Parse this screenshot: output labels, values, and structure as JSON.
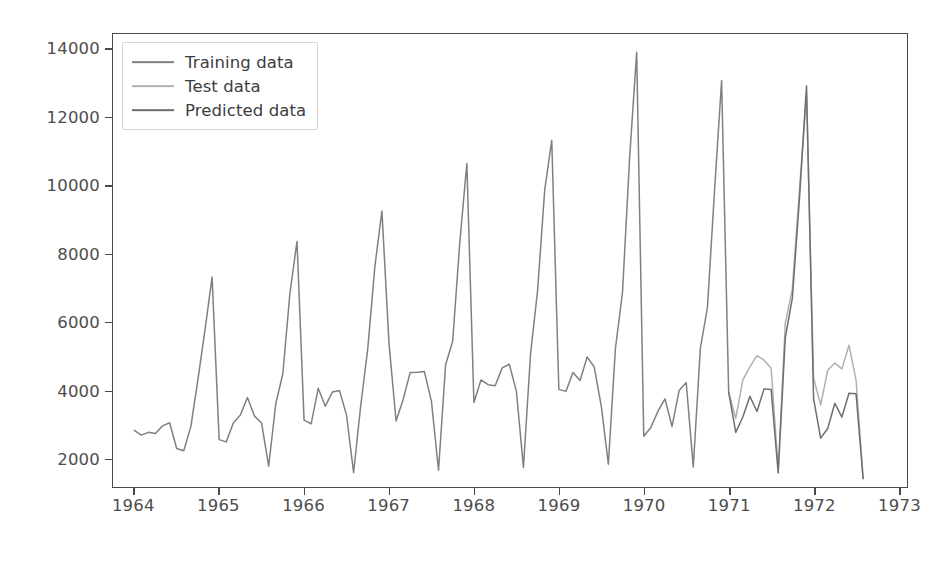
{
  "figure": {
    "background_color": "#ffffff",
    "axes_color": "#4a4a4a",
    "tick_label_color": "#4d4d4d"
  },
  "legend": {
    "position": "upper left",
    "entries": [
      {
        "label": "Training data",
        "color": "#808080",
        "icon": "line-swatch-icon"
      },
      {
        "label": "Test data",
        "color": "#b0b0b0",
        "icon": "line-swatch-icon"
      },
      {
        "label": "Predicted data",
        "color": "#6e6e6e",
        "icon": "line-swatch-icon"
      }
    ]
  },
  "chart_data": {
    "type": "line",
    "title": "",
    "xlabel": "",
    "ylabel": "",
    "xlim": [
      1963.75,
      1973.1
    ],
    "ylim": [
      1150,
      14450
    ],
    "grid": false,
    "legend_position": "upper left",
    "xticks": [
      1964,
      1965,
      1966,
      1967,
      1968,
      1969,
      1970,
      1971,
      1972,
      1973
    ],
    "xtick_labels": [
      "1964",
      "1965",
      "1966",
      "1967",
      "1968",
      "1969",
      "1970",
      "1971",
      "1972",
      "1973"
    ],
    "yticks": [
      2000,
      4000,
      6000,
      8000,
      10000,
      12000,
      14000
    ],
    "ytick_labels": [
      "2000",
      "4000",
      "6000",
      "8000",
      "10000",
      "12000",
      "14000"
    ],
    "series": [
      {
        "name": "Training data",
        "color": "#808080",
        "x": [
          1964.0,
          1964.0833,
          1964.1667,
          1964.25,
          1964.3333,
          1964.4167,
          1964.5,
          1964.5833,
          1964.6667,
          1964.75,
          1964.8333,
          1964.9167,
          1965.0,
          1965.0833,
          1965.1667,
          1965.25,
          1965.3333,
          1965.4167,
          1965.5,
          1965.5833,
          1965.6667,
          1965.75,
          1965.8333,
          1965.9167,
          1966.0,
          1966.0833,
          1966.1667,
          1966.25,
          1966.3333,
          1966.4167,
          1966.5,
          1966.5833,
          1966.6667,
          1966.75,
          1966.8333,
          1966.9167,
          1967.0,
          1967.0833,
          1967.1667,
          1967.25,
          1967.3333,
          1967.4167,
          1967.5,
          1967.5833,
          1967.6667,
          1967.75,
          1967.8333,
          1967.9167,
          1968.0,
          1968.0833,
          1968.1667,
          1968.25,
          1968.3333,
          1968.4167,
          1968.5,
          1968.5833,
          1968.6667,
          1968.75,
          1968.8333,
          1968.9167,
          1969.0,
          1969.0833,
          1969.1667,
          1969.25,
          1969.3333,
          1969.4167,
          1969.5,
          1969.5833,
          1969.6667,
          1969.75,
          1969.8333,
          1969.9167,
          1970.0,
          1970.0833,
          1970.1667,
          1970.25,
          1970.3333,
          1970.4167,
          1970.5,
          1970.5833,
          1970.6667,
          1970.75,
          1970.8333,
          1970.9167,
          1971.0
        ],
        "values": [
          2815,
          2672,
          2755,
          2721,
          2946,
          3036,
          2282,
          2212,
          2922,
          4301,
          5764,
          7312,
          2541,
          2475,
          3031,
          3266,
          3776,
          3230,
          3028,
          1759,
          3595,
          4474,
          6838,
          8357,
          3113,
          3006,
          4047,
          3523,
          3937,
          3986,
          3260,
          1573,
          3528,
          5211,
          7614,
          9254,
          5375,
          3088,
          3718,
          4514,
          4520,
          4539,
          3663,
          1643,
          4739,
          5428,
          8314,
          10651,
          3633,
          4292,
          4154,
          4121,
          4647,
          4753,
          3965,
          1723,
          5048,
          6922,
          9858,
          11331,
          4016,
          3957,
          4510,
          4276,
          4968,
          4677,
          3523,
          1821,
          5222,
          6872,
          10803,
          13916,
          2639,
          2899,
          3370,
          3740,
          2927,
          3986,
          4217,
          1738,
          5221,
          6424,
          9842,
          13076,
          3934
        ]
      },
      {
        "name": "Test data",
        "color": "#b0b0b0",
        "x": [
          1971.0,
          1971.0833,
          1971.1667,
          1971.25,
          1971.3333,
          1971.4167,
          1971.5,
          1971.5833,
          1971.6667,
          1971.75,
          1971.8333,
          1971.9167,
          1972.0,
          1972.0833,
          1972.1667,
          1972.25,
          1972.3333,
          1972.4167,
          1972.5,
          1972.5833
        ],
        "values": [
          3934,
          3162,
          4286,
          4676,
          5010,
          4874,
          4633,
          1659,
          5951,
          6981,
          9851,
          12670,
          4348,
          3564,
          4577,
          4788,
          4618,
          5312,
          4298,
          1413
        ]
      },
      {
        "name": "Predicted data",
        "color": "#6e6e6e",
        "x": [
          1971.0,
          1971.0833,
          1971.1667,
          1971.25,
          1971.3333,
          1971.4167,
          1971.5,
          1971.5833,
          1971.6667,
          1971.75,
          1971.8333,
          1971.9167,
          1972.0,
          1972.0833,
          1972.1667,
          1972.25,
          1972.3333,
          1972.4167,
          1972.5,
          1972.5833
        ],
        "values": [
          3934,
          2752,
          3204,
          3812,
          3368,
          4031,
          4010,
          1564,
          5530,
          6702,
          9602,
          12925,
          3746,
          2585,
          2866,
          3608,
          3204,
          3905,
          3886,
          1392
        ]
      }
    ]
  }
}
